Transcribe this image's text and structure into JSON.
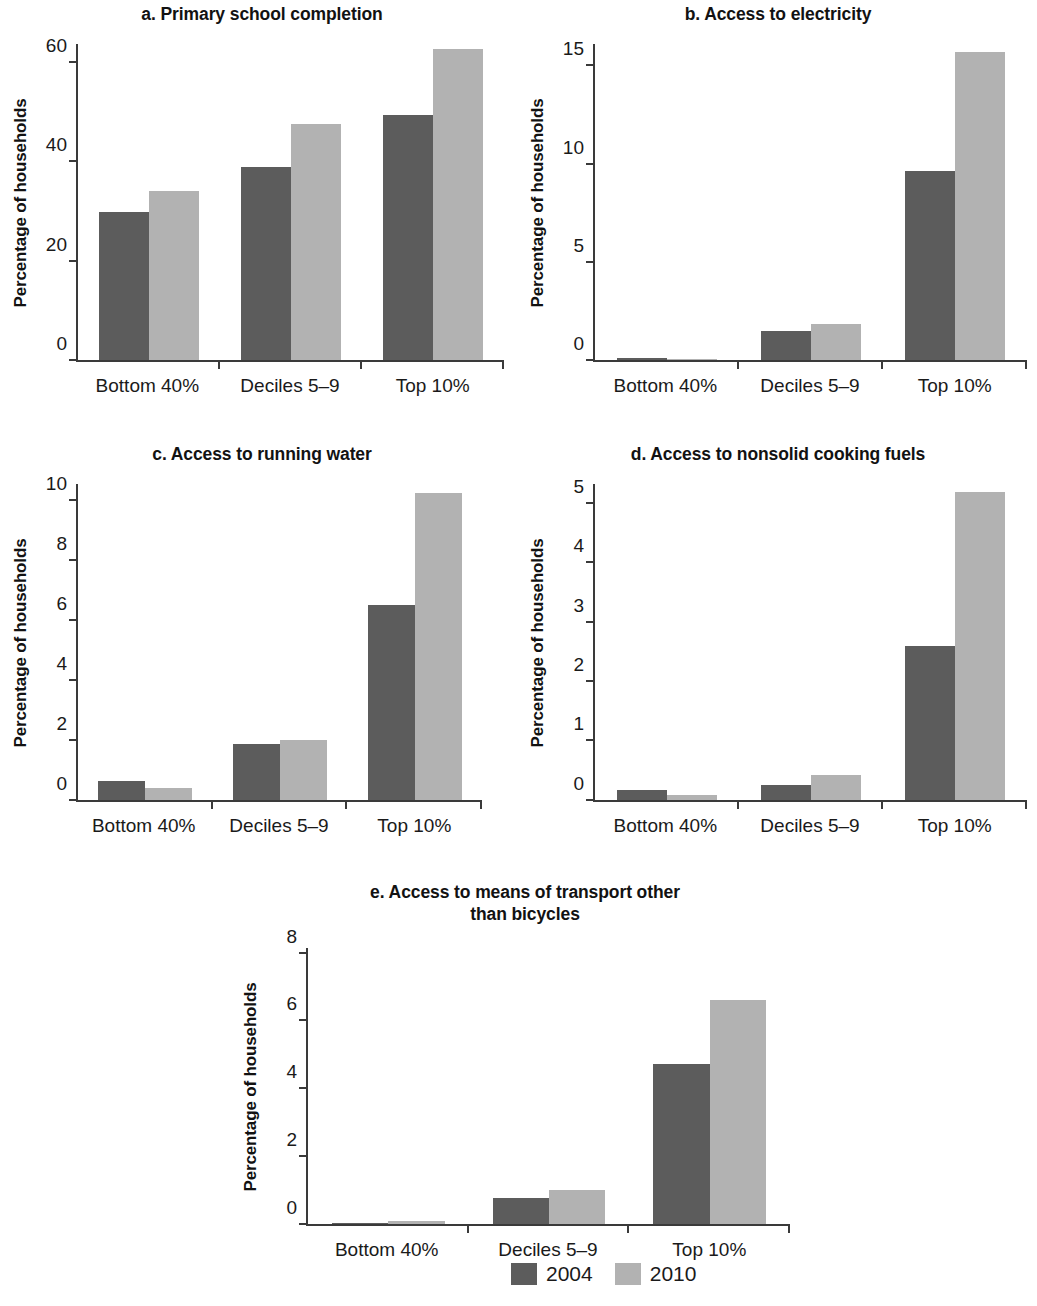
{
  "figure": {
    "axis_label": "Percentage of households",
    "categories": [
      "Bottom 40%",
      "Deciles 5–9",
      "Top 10%"
    ],
    "legend": {
      "entries": [
        {
          "label": "2004",
          "color": "#5c5c5c",
          "swatch": "legend-swatch-2004"
        },
        {
          "label": "2010",
          "color": "#b2b2b2",
          "swatch": "legend-swatch-2010"
        }
      ]
    },
    "colors": {
      "series_2004": "#5c5c5c",
      "series_2010": "#b2b2b2",
      "axis": "#3a3a3a",
      "text": "#1a1a1a",
      "background": "#ffffff"
    }
  },
  "panels": {
    "a": {
      "title": "a. Primary school completion",
      "ylabel": "Percentage of households",
      "yticks": [
        "0",
        "20",
        "40",
        "60"
      ]
    },
    "b": {
      "title": "b. Access to electricity",
      "ylabel": "Percentage of households",
      "yticks": [
        "0",
        "5",
        "10",
        "15"
      ]
    },
    "c": {
      "title": "c. Access to running water",
      "ylabel": "Percentage of households",
      "yticks": [
        "0",
        "2",
        "4",
        "6",
        "8",
        "10"
      ]
    },
    "d": {
      "title": "d. Access to nonsolid cooking fuels",
      "ylabel": "Percentage of households",
      "yticks": [
        "0",
        "1",
        "2",
        "3",
        "4",
        "5"
      ]
    },
    "e": {
      "title": "e.  Access to means of  transport other\nthan bicycles",
      "ylabel": "Percentage of households",
      "yticks": [
        "0",
        "2",
        "4",
        "6",
        "8"
      ]
    }
  },
  "chart_data": [
    {
      "id": "a",
      "type": "bar",
      "title": "a. Primary school completion",
      "xlabel": "",
      "ylabel": "Percentage of households",
      "categories": [
        "Bottom 40%",
        "Deciles 5–9",
        "Top 10%"
      ],
      "series": [
        {
          "name": "2004",
          "color": "#5c5c5c",
          "values": [
            30.0,
            39.0,
            49.5
          ]
        },
        {
          "name": "2010",
          "color": "#b2b2b2",
          "values": [
            34.2,
            47.8,
            63.0
          ]
        }
      ],
      "ylim": [
        0,
        64
      ],
      "yticks": [
        0,
        20,
        40,
        60
      ],
      "grid": false,
      "legend_position": "bottom-center"
    },
    {
      "id": "b",
      "type": "bar",
      "title": "b. Access to electricity",
      "xlabel": "",
      "ylabel": "Percentage of households",
      "categories": [
        "Bottom 40%",
        "Deciles 5–9",
        "Top 10%"
      ],
      "series": [
        {
          "name": "2004",
          "color": "#5c5c5c",
          "values": [
            0.1,
            1.5,
            9.7
          ]
        },
        {
          "name": "2010",
          "color": "#b2b2b2",
          "values": [
            0.02,
            1.85,
            15.8
          ]
        }
      ],
      "ylim": [
        0,
        16.2
      ],
      "yticks": [
        0,
        5,
        10,
        15
      ],
      "grid": false,
      "legend_position": "bottom-center"
    },
    {
      "id": "c",
      "type": "bar",
      "title": "c. Access to running water",
      "xlabel": "",
      "ylabel": "Percentage of households",
      "categories": [
        "Bottom 40%",
        "Deciles 5–9",
        "Top 10%"
      ],
      "series": [
        {
          "name": "2004",
          "color": "#5c5c5c",
          "values": [
            0.65,
            1.88,
            6.55
          ]
        },
        {
          "name": "2010",
          "color": "#b2b2b2",
          "values": [
            0.4,
            2.0,
            10.3
          ]
        }
      ],
      "ylim": [
        0,
        10.6
      ],
      "yticks": [
        0,
        2,
        4,
        6,
        8,
        10
      ],
      "grid": false,
      "legend_position": "bottom-center"
    },
    {
      "id": "d",
      "type": "bar",
      "title": "d. Access to nonsolid cooking fuels",
      "xlabel": "",
      "ylabel": "Percentage of households",
      "categories": [
        "Bottom 40%",
        "Deciles 5–9",
        "Top 10%"
      ],
      "series": [
        {
          "name": "2004",
          "color": "#5c5c5c",
          "values": [
            0.16,
            0.25,
            2.6
          ]
        },
        {
          "name": "2010",
          "color": "#b2b2b2",
          "values": [
            0.08,
            0.42,
            5.22
          ]
        }
      ],
      "ylim": [
        0,
        5.35
      ],
      "yticks": [
        0,
        1,
        2,
        3,
        4,
        5
      ],
      "grid": false,
      "legend_position": "bottom-center"
    },
    {
      "id": "e",
      "type": "bar",
      "title": "e.  Access to means of  transport other than bicycles",
      "xlabel": "",
      "ylabel": "Percentage of households",
      "categories": [
        "Bottom 40%",
        "Deciles 5–9",
        "Top 10%"
      ],
      "series": [
        {
          "name": "2004",
          "color": "#5c5c5c",
          "values": [
            0.03,
            0.78,
            4.75
          ]
        },
        {
          "name": "2010",
          "color": "#b2b2b2",
          "values": [
            0.08,
            1.0,
            6.65
          ]
        }
      ],
      "ylim": [
        0,
        8.2
      ],
      "yticks": [
        0,
        2,
        4,
        6,
        8
      ],
      "grid": false,
      "legend_position": "bottom-center"
    }
  ]
}
